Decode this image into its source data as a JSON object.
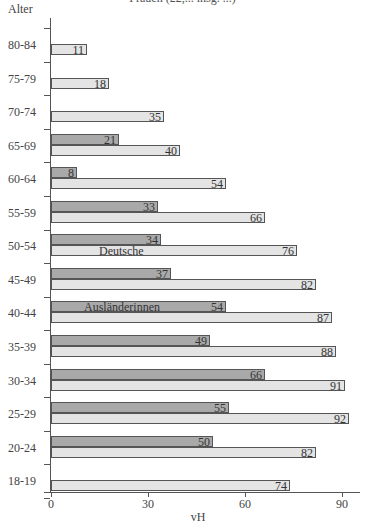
{
  "chart_data": {
    "type": "bar",
    "orientation": "horizontal",
    "title": "Frauen (22,... insg. ...)",
    "ylabel": "Alter",
    "xlabel": "vH",
    "xlim": [
      0,
      95
    ],
    "xticks": [
      "0",
      "30",
      "60",
      "90"
    ],
    "grid": false,
    "categories": [
      "80-84",
      "75-79",
      "70-74",
      "65-69",
      "60-64",
      "55-59",
      "50-54",
      "45-49",
      "40-44",
      "35-39",
      "30-34",
      "25-29",
      "20-24",
      "18-19"
    ],
    "series": [
      {
        "name": "Ausländerinnen",
        "color": "#a9a9a9",
        "values": [
          null,
          null,
          null,
          21,
          8,
          33,
          34,
          37,
          54,
          49,
          66,
          55,
          50,
          null
        ]
      },
      {
        "name": "Deutsche",
        "color": "#e4e4e4",
        "values": [
          11,
          18,
          35,
          40,
          54,
          66,
          76,
          82,
          87,
          88,
          91,
          92,
          82,
          74
        ]
      }
    ],
    "annotations": [
      {
        "text": "Deutsche",
        "category": "50-54",
        "series": "Deutsche"
      },
      {
        "text": "Ausländerinnen",
        "category": "40-44",
        "series": "Ausländerinnen"
      }
    ]
  }
}
